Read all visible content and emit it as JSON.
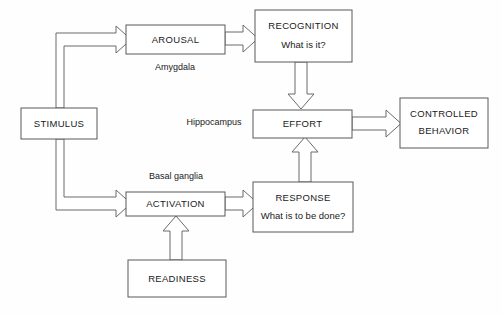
{
  "diagram": {
    "background_color": "#fefefe",
    "box_stroke_color": "#595959",
    "arrow_stroke_color": "#6b6b6b",
    "text_color": "#1a1a1a",
    "nodes": [
      {
        "id": "stimulus",
        "label": "STIMULUS",
        "sublabel": "",
        "x": 21,
        "y": 108,
        "w": 76,
        "h": 31
      },
      {
        "id": "arousal",
        "label": "AROUSAL",
        "sublabel": "",
        "x": 126,
        "y": 25,
        "w": 99,
        "h": 29
      },
      {
        "id": "recognition",
        "label": "RECOGNITION",
        "sublabel": "What is it?",
        "x": 255,
        "y": 10,
        "w": 97,
        "h": 52
      },
      {
        "id": "effort",
        "label": "EFFORT",
        "sublabel": "",
        "x": 253,
        "y": 110,
        "w": 99,
        "h": 28
      },
      {
        "id": "controlled-behavior",
        "label": "CONTROLLED",
        "sublabel": "BEHAVIOR",
        "x": 400,
        "y": 98,
        "w": 88,
        "h": 50
      },
      {
        "id": "activation",
        "label": "ACTIVATION",
        "sublabel": "",
        "x": 126,
        "y": 192,
        "w": 99,
        "h": 24
      },
      {
        "id": "response",
        "label": "RESPONSE",
        "sublabel": "What is to be done?",
        "x": 253,
        "y": 182,
        "w": 100,
        "h": 50
      },
      {
        "id": "readiness",
        "label": "READINESS",
        "sublabel": "",
        "x": 128,
        "y": 260,
        "w": 98,
        "h": 37
      }
    ],
    "region_labels": [
      {
        "id": "amygdala",
        "text": "Amygdala",
        "x": 175,
        "y": 68
      },
      {
        "id": "hippocampus",
        "text": "Hippocampus",
        "x": 214,
        "y": 123
      },
      {
        "id": "basal-ganglia",
        "text": "Basal ganglia",
        "x": 176,
        "y": 177
      }
    ],
    "arrows": [
      {
        "id": "stimulus-to-arousal",
        "from": "stimulus",
        "to": "arousal"
      },
      {
        "id": "arousal-to-recognition",
        "from": "arousal",
        "to": "recognition"
      },
      {
        "id": "recognition-to-effort",
        "from": "recognition",
        "to": "effort"
      },
      {
        "id": "effort-to-controlled-behavior",
        "from": "effort",
        "to": "controlled-behavior"
      },
      {
        "id": "stimulus-to-activation",
        "from": "stimulus",
        "to": "activation"
      },
      {
        "id": "activation-to-response",
        "from": "activation",
        "to": "response"
      },
      {
        "id": "response-to-effort",
        "from": "response",
        "to": "effort"
      },
      {
        "id": "readiness-to-activation",
        "from": "readiness",
        "to": "activation"
      }
    ]
  }
}
